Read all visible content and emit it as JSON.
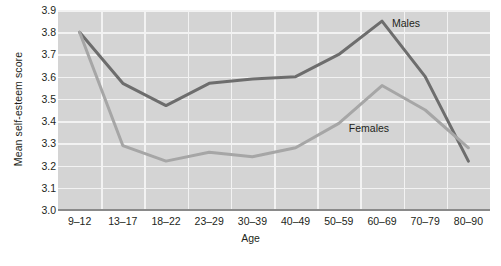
{
  "chart_data": {
    "type": "line",
    "title": "",
    "xlabel": "Age",
    "ylabel": "Mean self-esteem score",
    "categories": [
      "9–12",
      "13–17",
      "18–22",
      "23–29",
      "30–39",
      "40–49",
      "50–59",
      "60–69",
      "70–79",
      "80–90"
    ],
    "yticks": [
      "3.0",
      "3.1",
      "3.2",
      "3.3",
      "3.4",
      "3.5",
      "3.6",
      "3.7",
      "3.8",
      "3.9"
    ],
    "ylim": [
      3.0,
      3.9
    ],
    "grid": true,
    "legend_position": "inline-annotation",
    "series": [
      {
        "name": "Males",
        "color": "#6d6d6d",
        "values": [
          3.8,
          3.57,
          3.47,
          3.57,
          3.59,
          3.6,
          3.7,
          3.85,
          3.6,
          3.22
        ]
      },
      {
        "name": "Females",
        "color": "#a6a6a6",
        "values": [
          3.8,
          3.29,
          3.22,
          3.26,
          3.24,
          3.28,
          3.39,
          3.56,
          3.45,
          3.28
        ]
      }
    ],
    "annotations": [
      {
        "text": "Males",
        "x_category": "60–69",
        "value": 3.84
      },
      {
        "text": "Females",
        "x_category": "50–59",
        "value": 3.37
      }
    ],
    "colors": {
      "plot_background": "#d4d4d4",
      "gridline": "#f2f2f2",
      "axis": "#8a8a8a",
      "text": "#231f20"
    }
  }
}
